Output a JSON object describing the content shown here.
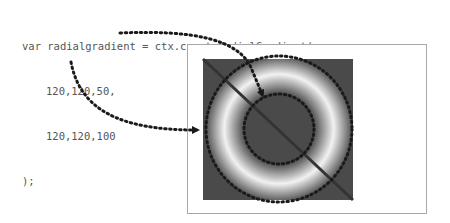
{
  "code": {
    "line1": "var radialgradient = ctx.createRadialGradient(",
    "line2": "120,120,50,",
    "line3": "120,120,100",
    "line4": ");"
  },
  "gradient": {
    "start_circle": {
      "x": 120,
      "y": 120,
      "r": 50
    },
    "end_circle": {
      "x": 120,
      "y": 120,
      "r": 100
    },
    "background_color": "#4a4a4a",
    "peak_color": "#f2f2f2",
    "line_color": "#333333",
    "dot_color": "#1a1a1a"
  },
  "annotations": [
    {
      "from": "start-circle-args",
      "to": "inner-circle",
      "label": "arrow-1"
    },
    {
      "from": "end-circle-args",
      "to": "outer-circle",
      "label": "arrow-2"
    }
  ]
}
